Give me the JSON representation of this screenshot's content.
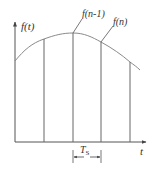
{
  "diagram": {
    "type": "sampling-signal-diagram",
    "y_axis_label": "f(t)",
    "x_axis_label": "t",
    "sample_labels": {
      "previous": "f(n-1)",
      "current": "f(n)"
    },
    "period_label": {
      "main": "T",
      "subscript": "S"
    },
    "colors": {
      "line": "#555555",
      "curve": "#8a8a8a",
      "text": "#333333",
      "background": "#ffffff"
    }
  }
}
